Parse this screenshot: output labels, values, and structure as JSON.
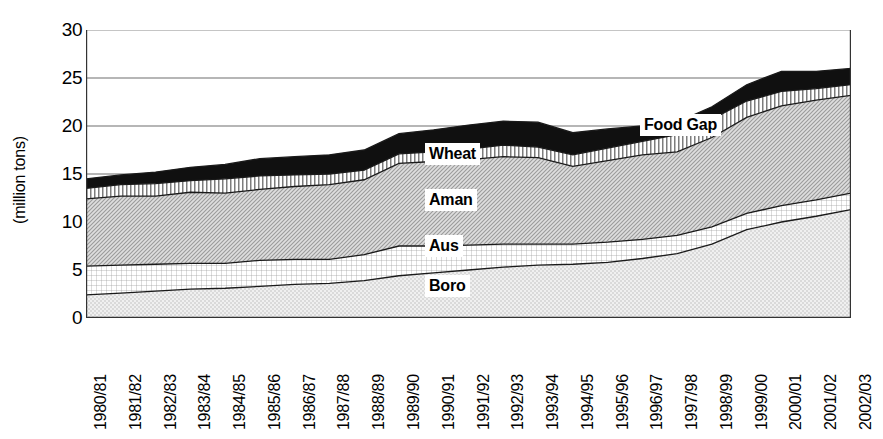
{
  "chart_data": {
    "type": "area",
    "title": "",
    "subtitle": "",
    "xlabel": "",
    "ylabel": "(million tons)",
    "ylim": [
      0,
      30
    ],
    "yticks": [
      0,
      5,
      10,
      15,
      20,
      25,
      30
    ],
    "grid": true,
    "legend_position": "inline-annotations",
    "stacked": true,
    "categories": [
      "1980/81",
      "1981/82",
      "1982/83",
      "1983/84",
      "1984/85",
      "1985/86",
      "1986/87",
      "1987/88",
      "1988/89",
      "1989/90",
      "1990/91",
      "1991/92",
      "1992/93",
      "1993/94",
      "1994/95",
      "1995/96",
      "1996/97",
      "1997/98",
      "1998/99",
      "1999/00",
      "2000/01",
      "2001/02",
      "2002/03"
    ],
    "series": [
      {
        "name": "Boro",
        "pattern": "light-stipple",
        "color": "#e3e3e3",
        "values": [
          2.4,
          2.6,
          2.8,
          3.0,
          3.1,
          3.3,
          3.5,
          3.6,
          3.9,
          4.4,
          4.7,
          5.0,
          5.3,
          5.5,
          5.6,
          5.8,
          6.2,
          6.7,
          7.7,
          9.2,
          10.0,
          10.6,
          11.3
        ]
      },
      {
        "name": "Aus",
        "pattern": "fine-grid",
        "color": "#fafafa",
        "values": [
          3.0,
          2.9,
          2.8,
          2.7,
          2.6,
          2.7,
          2.6,
          2.5,
          2.7,
          3.1,
          2.8,
          2.6,
          2.4,
          2.2,
          2.1,
          2.1,
          2.0,
          1.9,
          1.8,
          1.7,
          1.7,
          1.7,
          1.7
        ]
      },
      {
        "name": "Aman",
        "pattern": "diagonal-stipple",
        "color": "#d8d8d8",
        "values": [
          7.0,
          7.2,
          7.1,
          7.4,
          7.3,
          7.4,
          7.6,
          7.8,
          7.8,
          8.6,
          8.8,
          8.9,
          9.1,
          9.0,
          8.1,
          8.5,
          8.8,
          8.7,
          9.3,
          10.0,
          10.4,
          10.4,
          10.2
        ]
      },
      {
        "name": "Wheat",
        "pattern": "vertical-stripes",
        "color": "#ffffff",
        "values": [
          1.1,
          1.2,
          1.3,
          1.2,
          1.5,
          1.4,
          1.2,
          1.1,
          1.0,
          1.0,
          1.0,
          1.1,
          1.2,
          1.1,
          1.2,
          1.3,
          1.4,
          1.8,
          1.9,
          1.7,
          1.5,
          1.2,
          1.1
        ]
      },
      {
        "name": "Food Gap",
        "pattern": "solid-black",
        "color": "#101010",
        "values": [
          1.0,
          1.0,
          1.2,
          1.4,
          1.5,
          1.8,
          1.9,
          2.0,
          2.1,
          2.1,
          2.3,
          2.5,
          2.5,
          2.6,
          2.3,
          2.0,
          1.6,
          1.3,
          1.3,
          1.7,
          2.1,
          1.8,
          1.7
        ]
      }
    ],
    "annotations": [
      {
        "label": "Food Gap",
        "x": 640,
        "y": 118
      },
      {
        "label": "Wheat",
        "x": 425,
        "y": 145
      },
      {
        "label": "Aman",
        "x": 425,
        "y": 192
      },
      {
        "label": "Aus",
        "x": 425,
        "y": 238
      },
      {
        "label": "Boro",
        "x": 425,
        "y": 278
      }
    ]
  }
}
